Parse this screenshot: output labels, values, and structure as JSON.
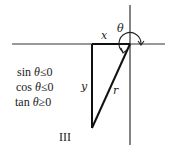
{
  "diagram": {
    "axes": {
      "color": "#333333"
    },
    "labels": {
      "theta": "θ",
      "x": "x",
      "y": "y",
      "r": "r"
    },
    "conditions": [
      {
        "func": "sin",
        "var": "θ",
        "rel": "≤",
        "val": "0"
      },
      {
        "func": "cos",
        "var": "θ",
        "rel": "≤",
        "val": "0"
      },
      {
        "func": "tan",
        "var": "θ",
        "rel": "≥",
        "val": "0"
      }
    ],
    "quadrant": "III"
  }
}
